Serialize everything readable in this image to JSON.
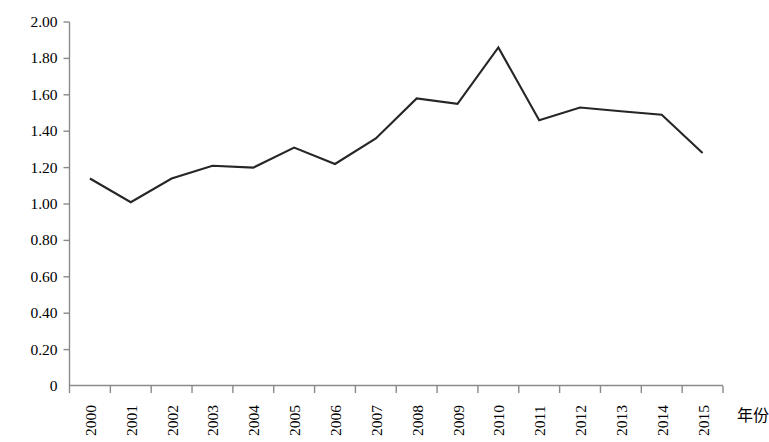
{
  "chart_data": {
    "type": "line",
    "title": "",
    "xlabel": "年份",
    "ylabel": "",
    "categories": [
      "2000",
      "2001",
      "2002",
      "2003",
      "2004",
      "2005",
      "2006",
      "2007",
      "2008",
      "2009",
      "2010",
      "2011",
      "2012",
      "2013",
      "2014",
      "2015"
    ],
    "values": [
      1.14,
      1.01,
      1.14,
      1.21,
      1.2,
      1.31,
      1.22,
      1.36,
      1.58,
      1.55,
      1.86,
      1.46,
      1.53,
      1.51,
      1.49,
      1.28
    ],
    "series": [
      {
        "name": "",
        "values": [
          1.14,
          1.01,
          1.14,
          1.21,
          1.2,
          1.31,
          1.22,
          1.36,
          1.58,
          1.55,
          1.86,
          1.46,
          1.53,
          1.51,
          1.49,
          1.28
        ]
      }
    ],
    "ylim": [
      0,
      2.0
    ],
    "ytick_labels": [
      "2.00",
      "1.80",
      "1.60",
      "1.40",
      "1.20",
      "1.00",
      "0.80",
      "0.60",
      "0.40",
      "0.20",
      "0"
    ],
    "ytick_values": [
      2.0,
      1.8,
      1.6,
      1.4,
      1.2,
      1.0,
      0.8,
      0.6,
      0.4,
      0.2,
      0
    ],
    "grid": false,
    "legend": "none",
    "line_color": "#262626",
    "axis_color": "#808080",
    "text_color": "#000000",
    "marker": "none",
    "x_tick_direction": "outward",
    "y_tick_direction": "outward"
  }
}
